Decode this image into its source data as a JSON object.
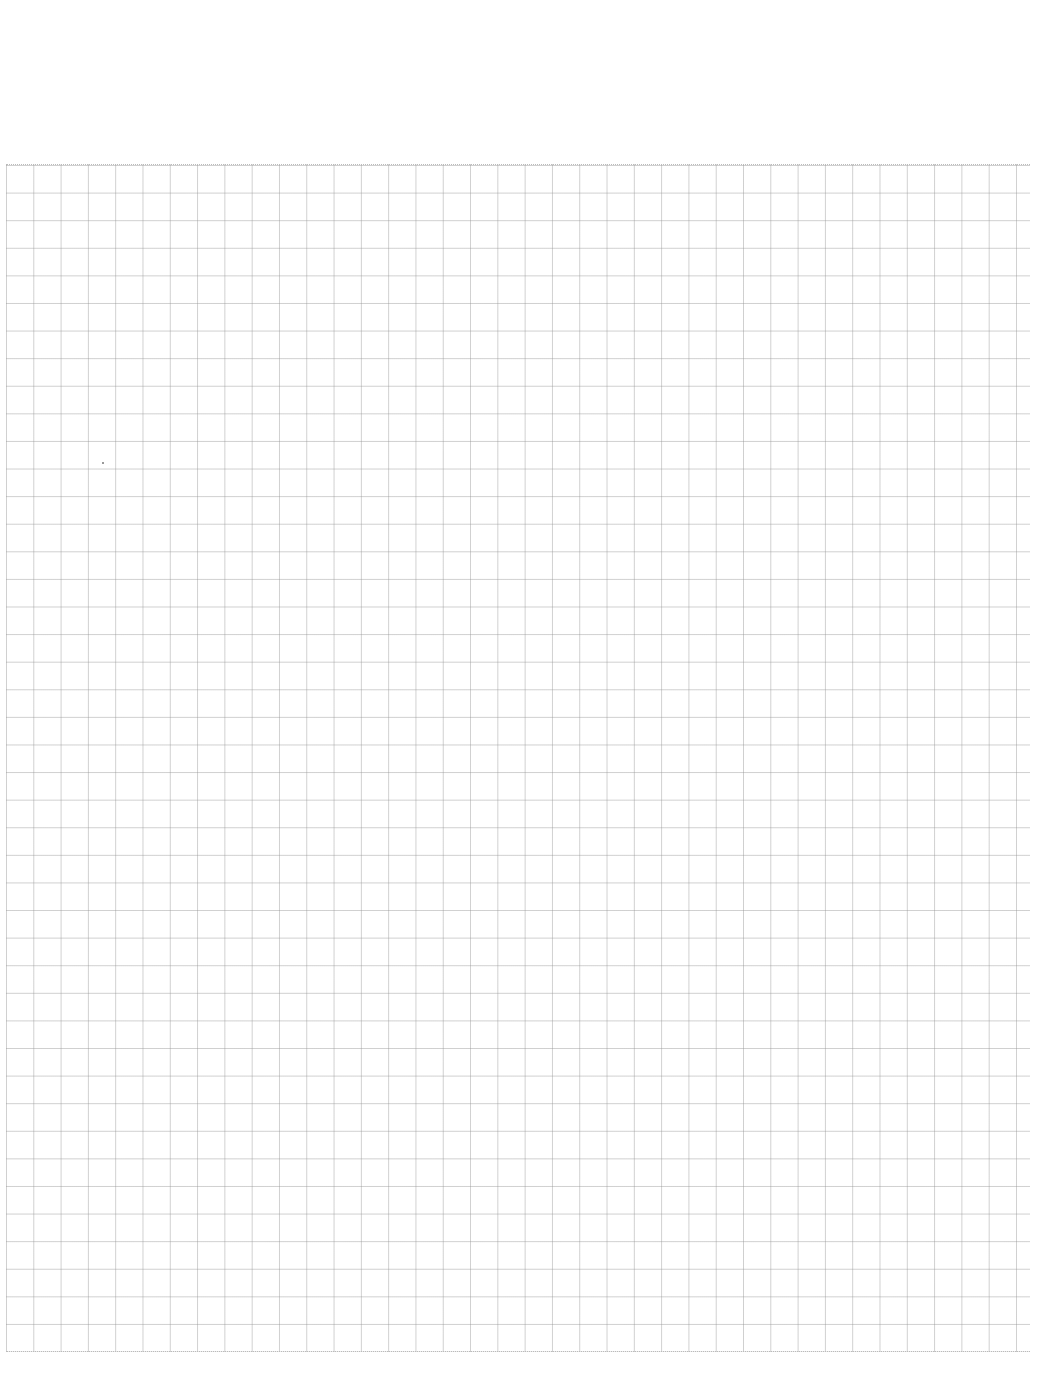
{
  "page": {
    "type": "blank-grid-paper",
    "grid_color": "#969696",
    "background_color": "#ffffff",
    "grid_columns": 37,
    "grid_rows": 43
  }
}
